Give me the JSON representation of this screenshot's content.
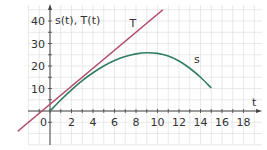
{
  "chart_data": {
    "type": "line",
    "title": "",
    "xlabel": "t",
    "ylabel": "s(t), T(t)",
    "xlim": [
      -4.5,
      19.5
    ],
    "ylim": [
      -9,
      48
    ],
    "grid": true,
    "x_ticks": [
      0,
      2,
      4,
      6,
      8,
      10,
      12,
      14,
      16,
      18
    ],
    "y_ticks": [
      10,
      20,
      30,
      40
    ],
    "series": [
      {
        "name": "s",
        "color": "#2e7d66",
        "x": [
          0,
          1,
          2,
          3,
          4,
          5,
          6,
          7,
          8,
          9,
          10,
          11,
          12,
          13,
          14,
          15
        ],
        "values": [
          0,
          4.9,
          9.4,
          13.5,
          17.0,
          20.0,
          22.4,
          24.2,
          25.4,
          25.9,
          25.6,
          24.4,
          22.2,
          19.0,
          15.0,
          10.2
        ]
      },
      {
        "name": "T",
        "color": "#b04a68",
        "x": [
          -3,
          10.5
        ],
        "values": [
          -9,
          45
        ]
      }
    ],
    "annotations": [
      {
        "text": "s",
        "x": 13.4,
        "y": 21.5
      },
      {
        "text": "T",
        "x": 7.4,
        "y": 37.5
      }
    ]
  },
  "labels": {
    "x_axis": "t",
    "y_axis": "s(t), T(t)",
    "origin": "0",
    "curve_s": "s",
    "curve_T": "T"
  }
}
